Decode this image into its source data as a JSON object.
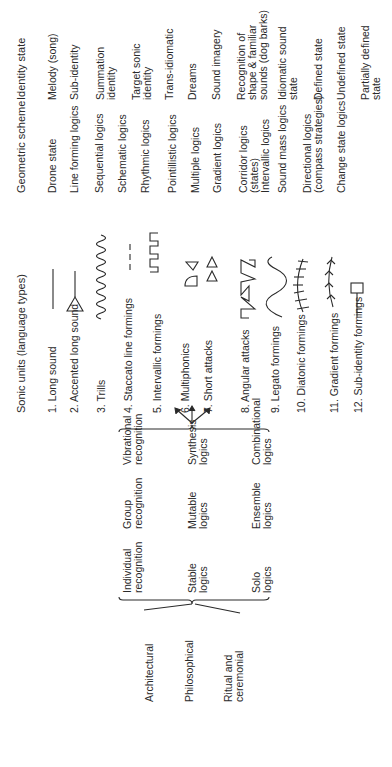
{
  "columns": {
    "sonic_units": "Sonic units (language types)",
    "geometric_scheme": "Geometric scheme",
    "identity_state": "Identity state"
  },
  "rows": [
    {
      "sonic": "1. Long sound",
      "glyph": "long-line",
      "scheme": "Drone state",
      "identity": "Melody (song)"
    },
    {
      "sonic": "2. Accented long sound",
      "glyph": "triangle-line",
      "scheme": "Line forming logics",
      "identity": "Sub-identity"
    },
    {
      "sonic": "3. Trills",
      "glyph": "trill-wave",
      "scheme": "Sequential logics",
      "identity": "Summation identity"
    },
    {
      "sonic": "4. Staccato line formings",
      "glyph": "dashed-line",
      "scheme": "Schematic logics",
      "identity": "Target sonic identity"
    },
    {
      "sonic": "5. Intervallic formings",
      "glyph": "square-wave",
      "scheme": "Rhythmic logics",
      "identity": "Trans-idiomatic"
    },
    {
      "sonic": "6. Multiphonics",
      "glyph": "bell-shapes",
      "scheme": "Pointillistic logics",
      "identity": "Dreams"
    },
    {
      "sonic": "7. Short attacks",
      "glyph": "small-triangles",
      "scheme": "Multiple logics",
      "identity": "Sound imagery"
    },
    {
      "sonic": "8. Angular attacks",
      "glyph": "angular-zigzag",
      "scheme": "Gradient logics",
      "identity": "Recognition of shape & familiar sounds (dog barks)"
    },
    {
      "sonic": "9. Legato formings",
      "glyph": "smooth-wave",
      "scheme": "Corridor logics (states) Intervallic logics",
      "identity": "Idiomatic sound state"
    },
    {
      "sonic": "10. Diatonic formings",
      "glyph": "ticked-curve",
      "scheme": "Sound mass logics",
      "identity": "Defined state"
    },
    {
      "sonic": "11. Gradient formings",
      "glyph": "arrowed-curve",
      "scheme": "Directional logics (compass strategies)",
      "identity": "Undefined state"
    },
    {
      "sonic": "12. Sub-identity formings",
      "glyph": "square-on-line",
      "scheme": "Change state logics",
      "identity": "Partially defined state"
    }
  ],
  "scheme_lines": {
    "r9a": "Corridor logics",
    "r9b": "(states)",
    "r9c": "Intervallic logics",
    "r11a": "Directional logics",
    "r11b": "(compass strategies)"
  },
  "identity_lines": {
    "r3a": "Summation",
    "r3b": "identity",
    "r4a": "Target sonic",
    "r4b": "identity",
    "r8a": "Recognition of",
    "r8b": "shape & familiar",
    "r8c": "sounds (dog barks)",
    "r9a": "Idiomatic sound",
    "r9b": "state",
    "r12a": "Partially defined",
    "r12b": "state"
  },
  "contexts": [
    {
      "label": "Architectural"
    },
    {
      "label": "Philosophical"
    },
    {
      "label": "Ritual and",
      "label2": "ceremonial"
    }
  ],
  "grid": {
    "row1": [
      {
        "a": "Individual",
        "b": "recognition"
      },
      {
        "a": "Group",
        "b": "recognition"
      },
      {
        "a": "Vibrational",
        "b": "recognition"
      }
    ],
    "row2": [
      {
        "a": "Stable",
        "b": "logics"
      },
      {
        "a": "Mutable",
        "b": "logics"
      },
      {
        "a": "Synthesis",
        "b": "logics"
      }
    ],
    "row3": [
      {
        "a": "Solo",
        "b": "logics"
      },
      {
        "a": "Ensemble",
        "b": "logics"
      },
      {
        "a": "Combinational",
        "b": "logics"
      }
    ]
  },
  "colors": {
    "ink": "#2a2a2a",
    "background": "#ffffff"
  }
}
